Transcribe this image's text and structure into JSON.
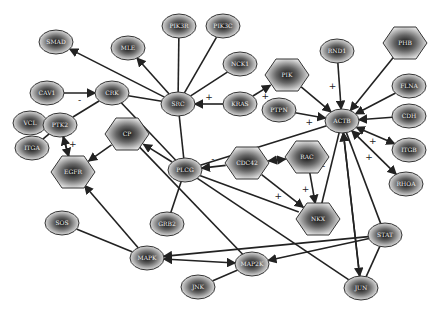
{
  "diagram": {
    "type": "gene-interaction-network",
    "nodes": [
      {
        "id": "n1",
        "label": "SMAD",
        "shape": "ellipse",
        "x": 56,
        "y": 42
      },
      {
        "id": "n2",
        "label": "MLE",
        "shape": "ellipse",
        "x": 128,
        "y": 48
      },
      {
        "id": "n3",
        "label": "PIK3R",
        "shape": "ellipse",
        "x": 179,
        "y": 26
      },
      {
        "id": "n4",
        "label": "PIK3C",
        "shape": "ellipse",
        "x": 223,
        "y": 26
      },
      {
        "id": "n5",
        "label": "NCK1",
        "shape": "ellipse",
        "x": 240,
        "y": 64
      },
      {
        "id": "n6",
        "label": "PIK",
        "shape": "hexagon",
        "x": 287,
        "y": 75
      },
      {
        "id": "n7",
        "label": "RND1",
        "shape": "ellipse",
        "x": 337,
        "y": 51
      },
      {
        "id": "n8",
        "label": "PHB",
        "shape": "hexagon",
        "x": 405,
        "y": 43
      },
      {
        "id": "n9",
        "label": "CAV1",
        "shape": "ellipse",
        "x": 47,
        "y": 93
      },
      {
        "id": "n10",
        "label": "CRK",
        "shape": "ellipse",
        "x": 112,
        "y": 93
      },
      {
        "id": "n11",
        "label": "SRC",
        "shape": "ellipse",
        "x": 178,
        "y": 104
      },
      {
        "id": "n12",
        "label": "KRAS",
        "shape": "ellipse",
        "x": 240,
        "y": 104
      },
      {
        "id": "n13",
        "label": "PTPN",
        "shape": "ellipse",
        "x": 279,
        "y": 110
      },
      {
        "id": "n14",
        "label": "ACTB",
        "shape": "ellipse",
        "x": 342,
        "y": 121
      },
      {
        "id": "n15",
        "label": "FLNA",
        "shape": "ellipse",
        "x": 409,
        "y": 86
      },
      {
        "id": "n16",
        "label": "CDH",
        "shape": "ellipse",
        "x": 409,
        "y": 116
      },
      {
        "id": "n17",
        "label": "VCL",
        "shape": "ellipse",
        "x": 30,
        "y": 123
      },
      {
        "id": "n18",
        "label": "PTK2",
        "shape": "ellipse",
        "x": 60,
        "y": 125
      },
      {
        "id": "n19",
        "label": "CP",
        "shape": "hexagon",
        "x": 127,
        "y": 134
      },
      {
        "id": "n20",
        "label": "ITGB",
        "shape": "ellipse",
        "x": 409,
        "y": 150
      },
      {
        "id": "n21",
        "label": "ITGA",
        "shape": "ellipse",
        "x": 32,
        "y": 148
      },
      {
        "id": "n22",
        "label": "PLCG",
        "shape": "ellipse",
        "x": 185,
        "y": 170
      },
      {
        "id": "n23",
        "label": "CDC42",
        "shape": "hexagon",
        "x": 247,
        "y": 163
      },
      {
        "id": "n24",
        "label": "RAC",
        "shape": "hexagon",
        "x": 307,
        "y": 157
      },
      {
        "id": "n25",
        "label": "EGFR",
        "shape": "hexagon",
        "x": 73,
        "y": 172
      },
      {
        "id": "n26",
        "label": "RHOA",
        "shape": "ellipse",
        "x": 406,
        "y": 184
      },
      {
        "id": "n27",
        "label": "GRB2",
        "shape": "ellipse",
        "x": 167,
        "y": 224
      },
      {
        "id": "n28",
        "label": "NKX",
        "shape": "hexagon",
        "x": 318,
        "y": 219
      },
      {
        "id": "n29",
        "label": "SOS",
        "shape": "ellipse",
        "x": 62,
        "y": 223
      },
      {
        "id": "n30",
        "label": "STAT",
        "shape": "ellipse",
        "x": 385,
        "y": 235
      },
      {
        "id": "n31",
        "label": "MAPK",
        "shape": "ellipse",
        "x": 147,
        "y": 258
      },
      {
        "id": "n32",
        "label": "MAP2K",
        "shape": "ellipse",
        "x": 252,
        "y": 264
      },
      {
        "id": "n33",
        "label": "JNK",
        "shape": "ellipse",
        "x": 198,
        "y": 287
      },
      {
        "id": "n34",
        "label": "JUN",
        "shape": "ellipse",
        "x": 361,
        "y": 288
      }
    ],
    "edges": [
      {
        "from": "n11",
        "to": "n1",
        "arrow": "end",
        "sign": ""
      },
      {
        "from": "n11",
        "to": "n2",
        "arrow": "end",
        "sign": ""
      },
      {
        "from": "n11",
        "to": "n3",
        "arrow": "none",
        "sign": ""
      },
      {
        "from": "n11",
        "to": "n4",
        "arrow": "none",
        "sign": ""
      },
      {
        "from": "n11",
        "to": "n5",
        "arrow": "none",
        "sign": ""
      },
      {
        "from": "n12",
        "to": "n11",
        "arrow": "end",
        "sign": "+"
      },
      {
        "from": "n12",
        "to": "n6",
        "arrow": "end",
        "sign": "+"
      },
      {
        "from": "n9",
        "to": "n10",
        "arrow": "end",
        "sign": "-"
      },
      {
        "from": "n11",
        "to": "n10",
        "arrow": "none",
        "sign": ""
      },
      {
        "from": "n18",
        "to": "n10",
        "arrow": "none",
        "sign": ""
      },
      {
        "from": "n17",
        "to": "n18",
        "arrow": "none",
        "sign": ""
      },
      {
        "from": "n21",
        "to": "n18",
        "arrow": "none",
        "sign": ""
      },
      {
        "from": "n25",
        "to": "n18",
        "arrow": "end",
        "sign": "+"
      },
      {
        "from": "n18",
        "to": "n25",
        "arrow": "end",
        "sign": ""
      },
      {
        "from": "n7",
        "to": "n14",
        "arrow": "end",
        "sign": "+"
      },
      {
        "from": "n8",
        "to": "n14",
        "arrow": "end",
        "sign": ""
      },
      {
        "from": "n6",
        "to": "n14",
        "arrow": "end",
        "sign": ""
      },
      {
        "from": "n15",
        "to": "n14",
        "arrow": "end",
        "sign": ""
      },
      {
        "from": "n16",
        "to": "n14",
        "arrow": "end",
        "sign": ""
      },
      {
        "from": "n14",
        "to": "n20",
        "arrow": "both",
        "sign": "+"
      },
      {
        "from": "n14",
        "to": "n26",
        "arrow": "both",
        "sign": "+"
      },
      {
        "from": "n13",
        "to": "n14",
        "arrow": "end",
        "sign": "+"
      },
      {
        "from": "n11",
        "to": "n22",
        "arrow": "none",
        "sign": ""
      },
      {
        "from": "n22",
        "to": "n14",
        "arrow": "none",
        "sign": ""
      },
      {
        "from": "n23",
        "to": "n22",
        "arrow": "end",
        "sign": "-"
      },
      {
        "from": "n23",
        "to": "n24",
        "arrow": "both",
        "sign": ""
      },
      {
        "from": "n23",
        "to": "n28",
        "arrow": "end",
        "sign": "+"
      },
      {
        "from": "n24",
        "to": "n28",
        "arrow": "end",
        "sign": "+"
      },
      {
        "from": "n14",
        "to": "n28",
        "arrow": "none",
        "sign": "-"
      },
      {
        "from": "n10",
        "to": "n22",
        "arrow": "none",
        "sign": "-"
      },
      {
        "from": "n22",
        "to": "n19",
        "arrow": "end",
        "sign": ""
      },
      {
        "from": "n22",
        "to": "n27",
        "arrow": "none",
        "sign": ""
      },
      {
        "from": "n22",
        "to": "n28",
        "arrow": "none",
        "sign": ""
      },
      {
        "from": "n19",
        "to": "n25",
        "arrow": "end",
        "sign": ""
      },
      {
        "from": "n31",
        "to": "n25",
        "arrow": "end",
        "sign": ""
      },
      {
        "from": "n29",
        "to": "n31",
        "arrow": "none",
        "sign": ""
      },
      {
        "from": "n31",
        "to": "n32",
        "arrow": "both",
        "sign": ""
      },
      {
        "from": "n33",
        "to": "n32",
        "arrow": "none",
        "sign": ""
      },
      {
        "from": "n30",
        "to": "n31",
        "arrow": "end",
        "sign": ""
      },
      {
        "from": "n30",
        "to": "n32",
        "arrow": "end",
        "sign": ""
      },
      {
        "from": "n22",
        "to": "n34",
        "arrow": "none",
        "sign": ""
      },
      {
        "from": "n14",
        "to": "n34",
        "arrow": "both",
        "sign": ""
      },
      {
        "from": "n34",
        "to": "n14",
        "arrow": "end",
        "sign": ""
      },
      {
        "from": "n30",
        "to": "n34",
        "arrow": "none",
        "sign": ""
      },
      {
        "from": "n14",
        "to": "n30",
        "arrow": "none",
        "sign": ""
      },
      {
        "from": "n19",
        "to": "n32",
        "arrow": "none",
        "sign": ""
      }
    ]
  }
}
